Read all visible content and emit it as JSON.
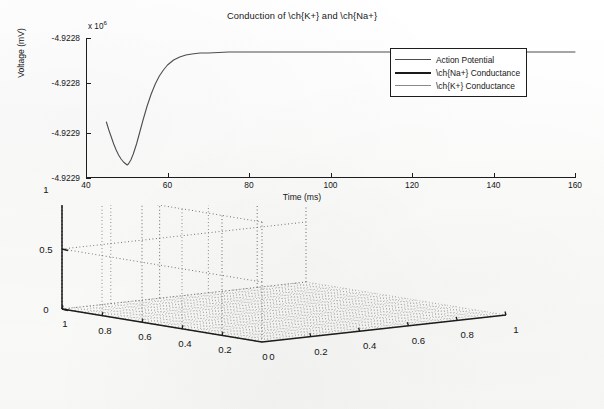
{
  "figure": {
    "background_color": "#fdfdfc",
    "ink_color": "#1d1d1d"
  },
  "chart_data": [
    {
      "type": "line",
      "id": "action-potential-plot",
      "title": "Conduction of \\ch{K+} and \\ch{Na+}",
      "xlabel": "Time (ms)",
      "ylabel": "Voltage (mV)",
      "xlim": [
        40,
        160
      ],
      "ylim": [
        -4.92292,
        -4.92278
      ],
      "y_axis_exponent_prefix": "x 10",
      "y_axis_exponent": "6",
      "grid": false,
      "xticks": [
        40,
        60,
        80,
        100,
        120,
        140,
        160
      ],
      "xtick_labels": [
        "40",
        "60",
        "80",
        "100",
        "120",
        "140",
        "160"
      ],
      "yticks": [
        -4.92278,
        -4.922825,
        -4.922875,
        -4.92292
      ],
      "ytick_labels": [
        "-4.9228",
        "-4.9228",
        "-4.9229",
        "-4.9229"
      ],
      "legend_position": "upper right",
      "series": [
        {
          "name": "Action Potential",
          "color": "#4d4d4d",
          "linewidth": 1.1,
          "x": [
            45,
            45.6,
            46.2,
            46.8,
            47.4,
            48,
            48.6,
            49.2,
            49.8,
            50.1,
            50.4,
            51,
            51.6,
            52.4,
            53.2,
            54,
            55,
            56,
            57,
            58,
            59,
            60,
            61.5,
            63,
            64.5,
            66,
            68,
            70,
            75,
            80,
            90,
            100,
            110,
            120,
            130,
            140,
            150,
            160
          ],
          "y": [
            -4.922864,
            -4.922872,
            -4.922879,
            -4.922886,
            -4.922892,
            -4.922897,
            -4.922901,
            -4.922904,
            -4.922906,
            -4.922907,
            -4.922906,
            -4.922902,
            -4.922896,
            -4.922886,
            -4.922874,
            -4.922862,
            -4.922848,
            -4.922836,
            -4.922826,
            -4.922818,
            -4.922812,
            -4.922807,
            -4.922802,
            -4.922799,
            -4.922797,
            -4.922796,
            -4.922795,
            -4.922795,
            -4.922794,
            -4.922794,
            -4.922794,
            -4.922794,
            -4.922794,
            -4.922794,
            -4.922794,
            -4.922794,
            -4.922794,
            -4.922794
          ]
        },
        {
          "name": "\\ch{Na+} Conductance",
          "color": "#1a1a1a",
          "linewidth": 2.0,
          "x": [],
          "y": [],
          "note": "legend entry only; trace not visible in plotted range"
        },
        {
          "name": "\\ch{K+} Conductance",
          "color": "#8a8a8a",
          "linewidth": 1.1,
          "x": [],
          "y": [],
          "note": "legend entry only; trace not visible in plotted range"
        }
      ],
      "legend_entries": [
        {
          "label": "Action Potential",
          "color": "#4d4d4d",
          "linewidth": 1.1
        },
        {
          "label": "\\ch{Na+} Conductance",
          "color": "#1a1a1a",
          "linewidth": 2.2
        },
        {
          "label": "\\ch{K+} Conductance",
          "color": "#8a8a8a",
          "linewidth": 1.3
        }
      ]
    },
    {
      "type": "surface",
      "id": "empty-3d-axes",
      "title": "",
      "xlabel": "",
      "ylabel": "",
      "zlabel": "",
      "xlim": [
        0,
        1
      ],
      "ylim": [
        0,
        1
      ],
      "zlim": [
        0,
        1
      ],
      "grid": true,
      "grid_style": "dotted",
      "view": "default-matlab-3d",
      "left_axis_ticks": [
        "1",
        "0.8",
        "0.6",
        "0.4",
        "0.2",
        "0"
      ],
      "right_axis_ticks": [
        "0",
        "0.2",
        "0.4",
        "0.6",
        "0.8",
        "1"
      ],
      "z_axis_ticks": [
        "0",
        "0.5",
        "1"
      ],
      "surface_values": "flat z = 0 mesh on floor plane (no data plotted)"
    }
  ]
}
